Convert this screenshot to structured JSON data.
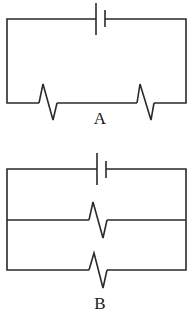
{
  "diagram": {
    "type": "circuit-schematics",
    "stroke_color": "#2a2a2a",
    "background": "#ffffff",
    "circuits": [
      {
        "id": "A",
        "label": "A",
        "configuration": "series",
        "components": [
          {
            "type": "battery",
            "icon": "battery-icon"
          },
          {
            "type": "resistor",
            "icon": "resistor-icon"
          },
          {
            "type": "resistor",
            "icon": "resistor-icon"
          }
        ]
      },
      {
        "id": "B",
        "label": "B",
        "configuration": "parallel",
        "components": [
          {
            "type": "battery",
            "icon": "battery-icon"
          },
          {
            "type": "resistor",
            "icon": "resistor-icon"
          },
          {
            "type": "resistor",
            "icon": "resistor-icon"
          }
        ]
      }
    ]
  }
}
